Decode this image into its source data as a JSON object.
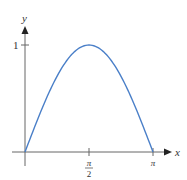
{
  "chart_data": {
    "type": "line",
    "title": "",
    "function": "y = sin(x)",
    "xlabel": "x",
    "ylabel": "y",
    "x_ticks": [
      {
        "value": 1.5708,
        "label": "π/2"
      },
      {
        "value": 3.1416,
        "label": "π"
      }
    ],
    "y_ticks": [
      {
        "value": 1,
        "label": "1"
      }
    ],
    "xlim": [
      0,
      3.1416
    ],
    "ylim": [
      0,
      1
    ],
    "series": [
      {
        "name": "sin x",
        "color": "#4a7fc8",
        "x": [
          0,
          0.3927,
          0.7854,
          1.1781,
          1.5708,
          1.9635,
          2.3562,
          2.7489,
          3.1416
        ],
        "y": [
          0,
          0.3827,
          0.7071,
          0.9239,
          1,
          0.9239,
          0.7071,
          0.3827,
          0
        ]
      }
    ],
    "grid": false,
    "legend": "none"
  },
  "labels": {
    "x_axis": "x",
    "y_axis": "y",
    "y_tick_1": "1",
    "x_tick_pi_num": "π",
    "x_tick_pi_den": "2",
    "x_tick_pi": "π"
  }
}
